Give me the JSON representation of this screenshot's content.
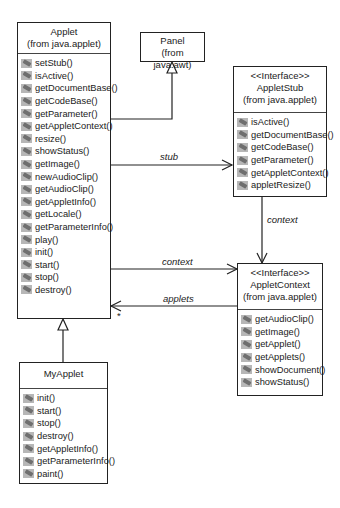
{
  "classes": {
    "applet": {
      "name": "Applet",
      "package": "(from java.applet)",
      "operations": [
        "setStub()",
        "isActive()",
        "getDocumentBase()",
        "getCodeBase()",
        "getParameter()",
        "getAppletContext()",
        "resize()",
        "showStatus()",
        "getImage()",
        "newAudioClip()",
        "getAudioClip()",
        "getAppletInfo()",
        "getLocale()",
        "getParameterInfo()",
        "play()",
        "init()",
        "start()",
        "stop()",
        "destroy()"
      ]
    },
    "panel": {
      "name": "Panel",
      "package": "(from java.awt)"
    },
    "applet_stub": {
      "stereotype": "<<Interface>>",
      "name": "AppletStub",
      "package": "(from java.applet)",
      "operations": [
        "isActive()",
        "getDocumentBase()",
        "getCodeBase()",
        "getParameter()",
        "getAppletContext()",
        "appletResize()"
      ]
    },
    "applet_context": {
      "stereotype": "<<Interface>>",
      "name": "AppletContext",
      "package": "(from java.applet)",
      "operations": [
        "getAudioClip()",
        "getImage()",
        "getApplet()",
        "getApplets()",
        "showDocument()",
        "showStatus()"
      ]
    },
    "my_applet": {
      "name": "MyApplet",
      "operations": [
        "init()",
        "start()",
        "stop()",
        "destroy()",
        "getAppletInfo()",
        "getParameterInfo()",
        "paint()"
      ]
    }
  },
  "associations": {
    "stub": "stub",
    "stub_context": "context",
    "applet_context": "context",
    "applets": "applets",
    "applets_multiplicity": "*"
  },
  "icons": {
    "operation": "method-icon"
  }
}
